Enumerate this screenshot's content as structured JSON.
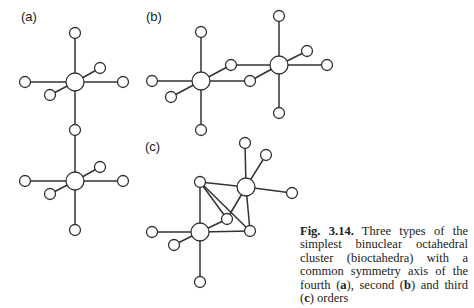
{
  "labels": {
    "a": "(a)",
    "b": "(b)",
    "c": "(c)"
  },
  "caption": {
    "fig_label": "Fig. 3.14.",
    "text_1": " Three types of the simplest binuclear octahedral cluster (bioctahedra) with a common symmetry axis of the fourth (",
    "a": "a",
    "text_2": "), second (",
    "b": "b",
    "text_3": ") and third (",
    "c": "c",
    "text_4": ") orders"
  },
  "diagram": {
    "metal_radius": 9,
    "ligand_radius": 5.5,
    "structures": [
      {
        "id": "a",
        "metals": [
          [
            75,
            82
          ],
          [
            75,
            181
          ]
        ],
        "ligands": [
          [
            75,
            33
          ],
          [
            25,
            82
          ],
          [
            123,
            82
          ],
          [
            100,
            68
          ],
          [
            50,
            95
          ],
          [
            75,
            130
          ],
          [
            25,
            181
          ],
          [
            123,
            181
          ],
          [
            100,
            167
          ],
          [
            50,
            194
          ],
          [
            75,
            230
          ]
        ],
        "bonds": [
          [
            75,
            33,
            75,
            82
          ],
          [
            25,
            82,
            75,
            82
          ],
          [
            75,
            82,
            123,
            82
          ],
          [
            75,
            82,
            100,
            68
          ],
          [
            75,
            82,
            50,
            95
          ],
          [
            75,
            82,
            75,
            130
          ],
          [
            75,
            130,
            75,
            181
          ],
          [
            25,
            181,
            75,
            181
          ],
          [
            75,
            181,
            123,
            181
          ],
          [
            75,
            181,
            100,
            167
          ],
          [
            75,
            181,
            50,
            194
          ],
          [
            75,
            181,
            75,
            230
          ]
        ]
      },
      {
        "id": "b",
        "metals": [
          [
            201,
            81
          ],
          [
            279,
            65
          ]
        ],
        "ligands": [
          [
            201,
            32
          ],
          [
            201,
            130
          ],
          [
            152,
            81
          ],
          [
            171,
            97
          ],
          [
            231,
            65
          ],
          [
            250,
            81
          ],
          [
            279,
            16
          ],
          [
            279,
            113
          ],
          [
            327,
            65
          ],
          [
            307,
            51
          ]
        ],
        "bonds": [
          [
            201,
            32,
            201,
            81
          ],
          [
            201,
            81,
            201,
            130
          ],
          [
            152,
            81,
            201,
            81
          ],
          [
            201,
            81,
            171,
            97
          ],
          [
            201,
            81,
            231,
            65
          ],
          [
            201,
            81,
            250,
            81
          ],
          [
            231,
            65,
            279,
            65
          ],
          [
            250,
            81,
            279,
            65
          ],
          [
            279,
            16,
            279,
            65
          ],
          [
            279,
            65,
            279,
            113
          ],
          [
            279,
            65,
            327,
            65
          ],
          [
            279,
            65,
            307,
            51
          ]
        ]
      },
      {
        "id": "c",
        "metals": [
          [
            200,
            232
          ],
          [
            246,
            187
          ]
        ],
        "ligands": [
          [
            245,
            143
          ],
          [
            266,
            155
          ],
          [
            292,
            193
          ],
          [
            200,
            182
          ],
          [
            227,
            219
          ],
          [
            250,
            231
          ],
          [
            152,
            232
          ],
          [
            174,
            245
          ],
          [
            200,
            282
          ]
        ],
        "bonds": [
          [
            245,
            143,
            246,
            187
          ],
          [
            246,
            187,
            266,
            155
          ],
          [
            246,
            187,
            292,
            193
          ],
          [
            200,
            182,
            246,
            187
          ],
          [
            246,
            187,
            227,
            219
          ],
          [
            246,
            187,
            250,
            231
          ],
          [
            200,
            182,
            200,
            232
          ],
          [
            200,
            182,
            227,
            219
          ],
          [
            200,
            182,
            250,
            231
          ],
          [
            200,
            232,
            227,
            219
          ],
          [
            200,
            232,
            250,
            231
          ],
          [
            152,
            232,
            200,
            232
          ],
          [
            200,
            232,
            174,
            245
          ],
          [
            200,
            232,
            200,
            282
          ]
        ]
      }
    ]
  }
}
